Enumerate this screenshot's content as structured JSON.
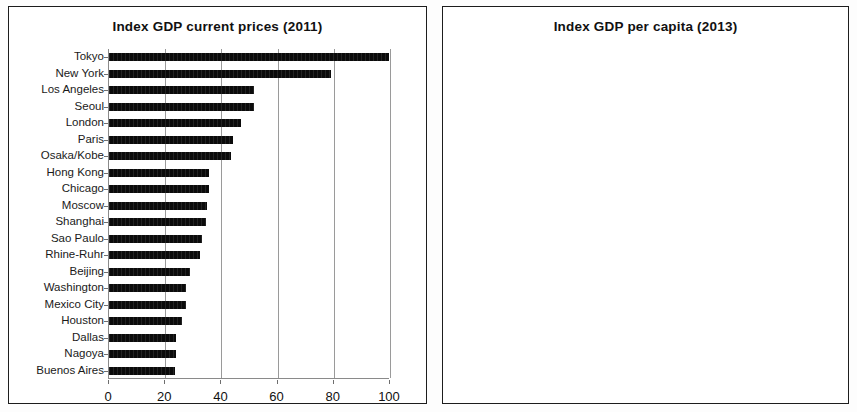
{
  "chart_data": [
    {
      "type": "bar",
      "orientation": "horizontal",
      "title": "Index GDP current prices (2011)",
      "xlabel": "",
      "ylabel": "",
      "xlim": [
        0,
        100
      ],
      "xticks": [
        0,
        20,
        40,
        60,
        80,
        100
      ],
      "grid": true,
      "legend": false,
      "categories": [
        "Tokyo",
        "New York",
        "Los Angeles",
        "Seoul",
        "London",
        "Paris",
        "Osaka/Kobe",
        "Hong Kong",
        "Chicago",
        "Moscow",
        "Shanghai",
        "Sao Paulo",
        "Rhine-Ruhr",
        "Beijing",
        "Washington",
        "Mexico City",
        "Houston",
        "Dallas",
        "Nagoya",
        "Buenos Aires"
      ],
      "values": [
        100,
        79,
        51.5,
        51.5,
        47,
        44,
        43.5,
        35.5,
        35.5,
        35,
        34.5,
        33,
        32.5,
        29,
        27.5,
        27.5,
        26,
        24,
        24,
        23.5
      ]
    },
    {
      "type": "bar",
      "orientation": "horizontal",
      "title": "Index GDP per capita (2013)",
      "xlabel": "",
      "ylabel": "",
      "xlim": [
        0,
        100
      ],
      "xticks": [
        0,
        20,
        40,
        60,
        80,
        100
      ],
      "grid": true,
      "legend": false,
      "categories": [
        "Zurich",
        "Oslo",
        "San Jose",
        "Hartford",
        "Geneva",
        "Paris",
        "Boston",
        "Washington",
        "Bridgeport",
        "Seattle",
        "Macau",
        "San Francisco",
        "Perth",
        "Calgary",
        "New York",
        "Portland",
        "Munich",
        "Houston",
        "Dublin",
        "Luxembourg/Trier"
      ],
      "values": [
        100,
        99,
        93,
        92.5,
        91,
        86,
        85.5,
        84,
        83.5,
        82.5,
        82,
        81,
        79.5,
        78,
        77.5,
        77.3,
        77.2,
        77,
        76.5,
        76.5
      ]
    }
  ],
  "panels": [
    {
      "name": "left-chart-panel"
    },
    {
      "name": "right-chart-panel"
    }
  ],
  "colors": {
    "bar": "#0b0b0b",
    "grid": "#9a9a9a",
    "axis": "#8a8a8a",
    "text": "#1a1a1a",
    "frame": "#1d1d1d",
    "background": "#ffffff"
  }
}
